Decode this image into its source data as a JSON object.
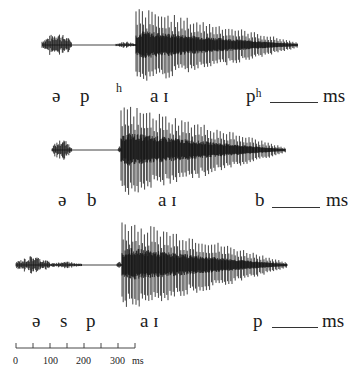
{
  "figure": {
    "ink_color": "#111111"
  },
  "rows": [
    {
      "id": "aspirated",
      "waveform": {
        "center_y": 45,
        "segments": [
          {
            "type": "noise",
            "x0": 42,
            "x1": 72,
            "amp": 14
          },
          {
            "type": "flat",
            "x0": 72,
            "x1": 116
          },
          {
            "type": "noise",
            "x0": 116,
            "x1": 136,
            "amp": 4
          },
          {
            "type": "voiced",
            "x0": 136,
            "x1": 298,
            "amp_top": 36,
            "amp_bot": 38,
            "period": 3.2
          }
        ]
      },
      "labels": [
        {
          "text": "ə",
          "x": 52,
          "y": 86
        },
        {
          "text": "p",
          "x": 80,
          "y": 86
        },
        {
          "text": "a ɪ",
          "x": 150,
          "y": 86
        },
        {
          "text": "pʰ",
          "x": 246,
          "y": 86
        },
        {
          "text": "ms",
          "x": 323,
          "y": 86
        }
      ],
      "superscripts": [
        {
          "text": "h",
          "x": 116,
          "y": 82
        }
      ],
      "blank": {
        "x0": 270,
        "x1": 318,
        "y": 102
      }
    },
    {
      "id": "voiced",
      "waveform": {
        "center_y": 150,
        "segments": [
          {
            "type": "noise",
            "x0": 52,
            "x1": 72,
            "amp": 12
          },
          {
            "type": "flat",
            "x0": 72,
            "x1": 118
          },
          {
            "type": "noise",
            "x0": 118,
            "x1": 121,
            "amp": 4
          },
          {
            "type": "voiced",
            "x0": 121,
            "x1": 285,
            "amp_top": 45,
            "amp_bot": 46,
            "period": 3.2
          }
        ]
      },
      "labels": [
        {
          "text": "ə",
          "x": 58,
          "y": 190
        },
        {
          "text": "b",
          "x": 87,
          "y": 190
        },
        {
          "text": "a ɪ",
          "x": 158,
          "y": 190
        },
        {
          "text": "b",
          "x": 255,
          "y": 190
        },
        {
          "text": "ms",
          "x": 326,
          "y": 190
        }
      ],
      "superscripts": [],
      "blank": {
        "x0": 272,
        "x1": 320,
        "y": 207
      }
    },
    {
      "id": "s-cluster",
      "waveform": {
        "center_y": 265,
        "segments": [
          {
            "type": "noise",
            "x0": 16,
            "x1": 50,
            "amp": 10
          },
          {
            "type": "noise",
            "x0": 50,
            "x1": 82,
            "amp": 4
          },
          {
            "type": "flat",
            "x0": 82,
            "x1": 117
          },
          {
            "type": "noise",
            "x0": 117,
            "x1": 122,
            "amp": 4
          },
          {
            "type": "voiced",
            "x0": 122,
            "x1": 287,
            "amp_top": 45,
            "amp_bot": 45,
            "period": 3.2
          }
        ]
      },
      "labels": [
        {
          "text": "ə",
          "x": 32,
          "y": 311
        },
        {
          "text": "s",
          "x": 60,
          "y": 311
        },
        {
          "text": "p",
          "x": 86,
          "y": 311
        },
        {
          "text": "a ɪ",
          "x": 140,
          "y": 311
        },
        {
          "text": "p",
          "x": 253,
          "y": 311
        },
        {
          "text": "ms",
          "x": 322,
          "y": 311
        }
      ],
      "superscripts": [],
      "blank": {
        "x0": 272,
        "x1": 318,
        "y": 327
      }
    }
  ],
  "scale_bar": {
    "x0": 16,
    "x1": 135,
    "y": 348,
    "tick_count": 8,
    "tick_step_ms": 50,
    "tick_labels": [
      {
        "text": "0",
        "x": 13
      },
      {
        "text": "100",
        "x": 43
      },
      {
        "text": "200",
        "x": 76
      },
      {
        "text": "300",
        "x": 110
      },
      {
        "text": "ms",
        "x": 132
      }
    ],
    "label_y": 356
  }
}
